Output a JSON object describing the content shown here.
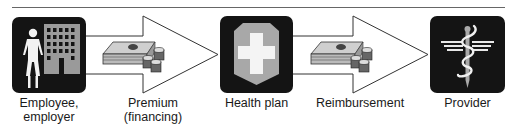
{
  "diagram": {
    "type": "flow",
    "nodes": [
      {
        "id": "employee",
        "label": "Employee,\nemployer",
        "icon": "person-building-icon"
      },
      {
        "id": "health_plan",
        "label": "Health plan",
        "icon": "shield-cross-icon"
      },
      {
        "id": "provider",
        "label": "Provider",
        "icon": "caduceus-icon"
      }
    ],
    "edges": [
      {
        "from": "employee",
        "to": "health_plan",
        "label": "Premium\n(financing)",
        "icon": "money-icon"
      },
      {
        "from": "health_plan",
        "to": "provider",
        "label": "Reimbursement",
        "icon": "money-icon"
      }
    ]
  },
  "colors": {
    "box": "#141414",
    "icon_gray": "#a8a8a8",
    "icon_white": "#f2f2f2",
    "rule": "#555555"
  }
}
